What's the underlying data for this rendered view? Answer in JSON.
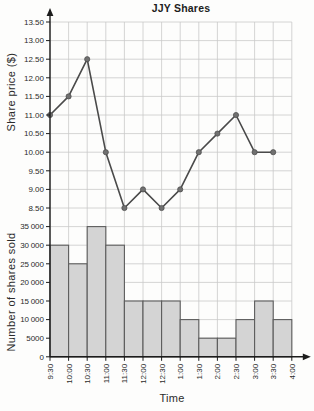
{
  "title": "JJY Shares",
  "axes": {
    "x_title": "Time",
    "x_labels": [
      "9:30",
      "10:00",
      "10:30",
      "11:00",
      "11:30",
      "12:00",
      "12:30",
      "1:00",
      "1:30",
      "2:00",
      "2:30",
      "3:00",
      "3:30",
      "4:00"
    ],
    "price_axis_title": "Share price ($)",
    "volume_axis_title": "Number of shares sold"
  },
  "chart_data": [
    {
      "type": "line",
      "title": "JJY Shares",
      "ylabel": "Share price ($)",
      "x": [
        "9:30",
        "10:00",
        "10:30",
        "11:00",
        "11:30",
        "12:00",
        "12:30",
        "1:00",
        "1:30",
        "2:00",
        "2:30",
        "3:00",
        "3:30"
      ],
      "values": [
        11.0,
        11.5,
        12.5,
        10.0,
        8.5,
        9.0,
        8.5,
        9.0,
        10.0,
        10.5,
        11.0,
        10.0,
        10.0
      ],
      "ylim": [
        8.5,
        13.5
      ],
      "ytick_step": 0.5,
      "ytick_labels": [
        "13.50",
        "13.00",
        "12.50",
        "12.00",
        "11.50",
        "11.00",
        "10.50",
        "10.00",
        "9.50",
        "9.00",
        "8.50"
      ],
      "grid": true,
      "legend": "none",
      "marker": "circle"
    },
    {
      "type": "bar",
      "ylabel": "Number of shares sold",
      "xlabel": "Time",
      "bin_edges": [
        "9:30",
        "10:00",
        "10:30",
        "11:00",
        "11:30",
        "12:00",
        "12:30",
        "1:00",
        "1:30",
        "2:00",
        "2:30",
        "3:00",
        "3:30",
        "4:00"
      ],
      "values": [
        30000,
        25000,
        35000,
        30000,
        15000,
        15000,
        15000,
        10000,
        5000,
        5000,
        10000,
        15000,
        10000
      ],
      "ylim": [
        0,
        35000
      ],
      "ytick_step": 5000,
      "ytick_labels": [
        "35 000",
        "30 000",
        "25 000",
        "20 000",
        "15 000",
        "10 000",
        "5000",
        "0"
      ],
      "grid": true,
      "legend": "none"
    }
  ],
  "colors": {
    "background": "#fdfdfc",
    "grid": "#c9c9c9",
    "axis": "#1c1c1c",
    "text": "#2b2b2b",
    "line": "#4a4a4a",
    "point": "#707070",
    "bar_fill": "#d4d4d4",
    "bar_stroke": "#5c5c5c"
  }
}
